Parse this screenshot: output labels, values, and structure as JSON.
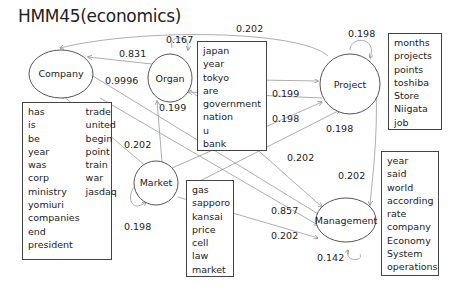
{
  "title": "HMM45(economics)",
  "nodes": {
    "company": {
      "label": "Company"
    },
    "organ": {
      "label": "Organ"
    },
    "project": {
      "label": "Project"
    },
    "market": {
      "label": "Market"
    },
    "management": {
      "label": "Management"
    }
  },
  "edge_labels": {
    "project_to_company": "0.202",
    "organ_self": "0.167",
    "organ_to_company": "0.831",
    "company_to_management": "0.9996",
    "organ_to_project": "0.199",
    "market_to_organ": "0.199",
    "market_to_project": "0.198",
    "project_self": "0.198",
    "management_to_project": "0.198",
    "market_to_company": "0.202",
    "organ_to_management": "0.202",
    "project_to_management": "0.202",
    "market_to_management_a": "0.857",
    "market_to_management_b": "0.202",
    "market_self": "0.198",
    "management_self": "0.142"
  },
  "word_boxes": {
    "company": {
      "col1": [
        "has",
        "is",
        "be",
        "year",
        "was",
        "corp",
        "ministry",
        "yomiuri",
        "companies",
        "end",
        "president"
      ],
      "col2": [
        "trade",
        "united",
        "begin",
        "point",
        "train",
        "war",
        "jasdaq"
      ]
    },
    "organ": [
      "japan",
      "year",
      "tokyo",
      "are",
      "government",
      "nation",
      "u",
      "bank"
    ],
    "project": [
      "months",
      "projects",
      "points",
      "toshiba",
      "Store",
      "Niigata",
      "job"
    ],
    "market": [
      "gas",
      "sapporo",
      "kansai",
      "price",
      "cell",
      "law",
      "market"
    ],
    "management": [
      "year",
      "said",
      "world",
      "according",
      "rate",
      "company",
      "Economy",
      "System",
      "operations"
    ]
  }
}
